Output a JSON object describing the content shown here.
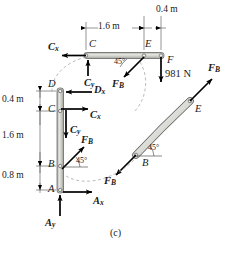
{
  "figure": {
    "caption": "(c)",
    "colors": {
      "member_fill": "#c9c9c4",
      "member_stroke": "#4a4a4a",
      "line": "#000000",
      "dashed": "#9a9a9a",
      "text": "#1a1a1a"
    }
  },
  "dimensions": [
    {
      "id": "d-1p6",
      "label": "1.6 m"
    },
    {
      "id": "d-0p4-top",
      "label": "0.4 m"
    },
    {
      "id": "d-0p4-left",
      "label": "0.4 m"
    },
    {
      "id": "d-1p6-left",
      "label": "1.6 m"
    },
    {
      "id": "d-0p8-left",
      "label": "0.8 m"
    }
  ],
  "points": {
    "top_member": [
      {
        "id": "C",
        "label": "C"
      },
      {
        "id": "E",
        "label": "E"
      },
      {
        "id": "F",
        "label": "F"
      }
    ],
    "vertical_member": [
      {
        "id": "D",
        "label": "D"
      },
      {
        "id": "C",
        "label": "C"
      },
      {
        "id": "B",
        "label": "B"
      },
      {
        "id": "A",
        "label": "A"
      }
    ],
    "curved_member": [
      {
        "id": "E",
        "label": "E"
      },
      {
        "id": "B",
        "label": "B"
      }
    ]
  },
  "forces": {
    "top_member": [
      {
        "id": "Cx-top",
        "base": "C",
        "sub": "x",
        "direction": "left"
      },
      {
        "id": "Cy-top",
        "base": "C",
        "sub": "y",
        "direction": "up"
      },
      {
        "id": "FB-top",
        "base": "F",
        "sub": "B",
        "direction": "down-left-45"
      },
      {
        "id": "load-F",
        "label": "981 N",
        "direction": "down"
      }
    ],
    "vertical_member": [
      {
        "id": "Dx",
        "base": "D",
        "sub": "x",
        "direction": "left"
      },
      {
        "id": "Cx-vert",
        "base": "C",
        "sub": "x",
        "direction": "right"
      },
      {
        "id": "Cy-vert",
        "base": "C",
        "sub": "y",
        "direction": "down"
      },
      {
        "id": "FB-vert",
        "base": "F",
        "sub": "B",
        "direction": "up-right-45"
      },
      {
        "id": "Ax",
        "base": "A",
        "sub": "x",
        "direction": "right"
      },
      {
        "id": "Ay",
        "base": "A",
        "sub": "y",
        "direction": "up"
      }
    ],
    "curved_member": [
      {
        "id": "FB-curve-E",
        "base": "F",
        "sub": "B",
        "direction": "up-right-45"
      },
      {
        "id": "FB-curve-B",
        "base": "F",
        "sub": "B",
        "direction": "down-left-45"
      }
    ]
  },
  "angles": [
    {
      "id": "ang-top",
      "label": "45°"
    },
    {
      "id": "ang-vert",
      "label": "45°"
    },
    {
      "id": "ang-curve",
      "label": "45°"
    }
  ]
}
